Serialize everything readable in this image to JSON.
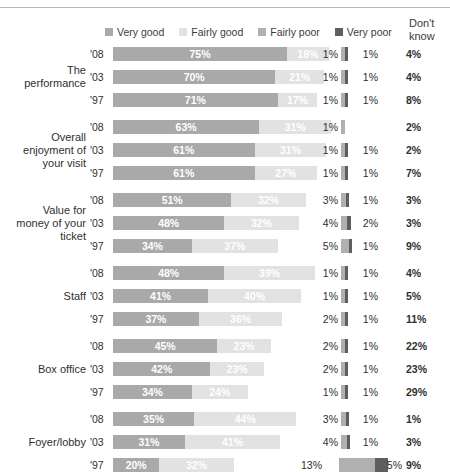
{
  "legend": {
    "items": [
      {
        "label": "Very good",
        "key": "very_good",
        "color": "#a9a9a9",
        "icon": "legend-swatch-icon"
      },
      {
        "label": "Fairly good",
        "key": "fairly_good",
        "color": "#e2e2e2",
        "icon": "legend-swatch-icon"
      },
      {
        "label": "Fairly poor",
        "key": "fairly_poor",
        "color": "#b0b0b0",
        "icon": "legend-swatch-icon"
      },
      {
        "label": "Very poor",
        "key": "very_poor",
        "color": "#5e5e5e",
        "icon": "legend-swatch-icon"
      }
    ]
  },
  "dont_know_header": "Don't\nknow",
  "dont_know_header_line1": "Don't",
  "dont_know_header_line2": "know",
  "chart_data": {
    "type": "bar",
    "subtype": "stacked-horizontal",
    "title": "",
    "xlabel": "",
    "ylabel": "",
    "xlim": [
      0,
      100
    ],
    "grid": false,
    "legend_position": "top",
    "units": "%",
    "series": [
      {
        "name": "Very good",
        "color": "#a9a9a9"
      },
      {
        "name": "Fairly good",
        "color": "#e2e2e2"
      },
      {
        "name": "Fairly poor",
        "color": "#b0b0b0"
      },
      {
        "name": "Very poor",
        "color": "#5e5e5e"
      }
    ],
    "extra_column": {
      "name": "Don't know"
    },
    "groups": [
      {
        "category": "The performance",
        "category_lines": [
          "The",
          "performance"
        ],
        "rows": [
          {
            "year": "'08",
            "very_good": 75,
            "fairly_good": 18,
            "fairly_poor": 1,
            "very_poor": 1,
            "dont_know": 4,
            "labels": {
              "very_good": "75%",
              "fairly_good": "18%",
              "fairly_poor": "1%",
              "very_poor": "1%",
              "dont_know": "4%"
            }
          },
          {
            "year": "'03",
            "very_good": 70,
            "fairly_good": 21,
            "fairly_poor": 1,
            "very_poor": 1,
            "dont_know": 4,
            "labels": {
              "very_good": "70%",
              "fairly_good": "21%",
              "fairly_poor": "1%",
              "very_poor": "1%",
              "dont_know": "4%"
            }
          },
          {
            "year": "'97",
            "very_good": 71,
            "fairly_good": 17,
            "fairly_poor": 1,
            "very_poor": 1,
            "dont_know": 8,
            "labels": {
              "very_good": "71%",
              "fairly_good": "17%",
              "fairly_poor": "1%",
              "very_poor": "1%",
              "dont_know": "8%"
            }
          }
        ]
      },
      {
        "category": "Overall enjoyment of your visit",
        "category_lines": [
          "Overall",
          "enjoyment of",
          "your visit"
        ],
        "rows": [
          {
            "year": "'08",
            "very_good": 63,
            "fairly_good": 31,
            "fairly_poor": 1,
            "very_poor": 0,
            "dont_know": 2,
            "labels": {
              "very_good": "63%",
              "fairly_good": "31%",
              "fairly_poor": "1%",
              "very_poor": "",
              "dont_know": "2%"
            }
          },
          {
            "year": "'03",
            "very_good": 61,
            "fairly_good": 31,
            "fairly_poor": 1,
            "very_poor": 1,
            "dont_know": 2,
            "labels": {
              "very_good": "61%",
              "fairly_good": "31%",
              "fairly_poor": "1%",
              "very_poor": "1%",
              "dont_know": "2%"
            }
          },
          {
            "year": "'97",
            "very_good": 61,
            "fairly_good": 27,
            "fairly_poor": 1,
            "very_poor": 1,
            "dont_know": 7,
            "labels": {
              "very_good": "61%",
              "fairly_good": "27%",
              "fairly_poor": "1%",
              "very_poor": "1%",
              "dont_know": "7%"
            }
          }
        ]
      },
      {
        "category": "Value for money of your ticket",
        "category_lines": [
          "Value for",
          "money of your",
          "ticket"
        ],
        "rows": [
          {
            "year": "'08",
            "very_good": 51,
            "fairly_good": 32,
            "fairly_poor": 3,
            "very_poor": 1,
            "dont_know": 3,
            "labels": {
              "very_good": "51%",
              "fairly_good": "32%",
              "fairly_poor": "3%",
              "very_poor": "1%",
              "dont_know": "3%"
            }
          },
          {
            "year": "'03",
            "very_good": 48,
            "fairly_good": 32,
            "fairly_poor": 4,
            "very_poor": 2,
            "dont_know": 3,
            "labels": {
              "very_good": "48%",
              "fairly_good": "32%",
              "fairly_poor": "4%",
              "very_poor": "2%",
              "dont_know": "3%"
            }
          },
          {
            "year": "'97",
            "very_good": 34,
            "fairly_good": 37,
            "fairly_poor": 5,
            "very_poor": 1,
            "dont_know": 9,
            "labels": {
              "very_good": "34%",
              "fairly_good": "37%",
              "fairly_poor": "5%",
              "very_poor": "1%",
              "dont_know": "9%"
            }
          }
        ]
      },
      {
        "category": "Staff",
        "category_lines": [
          "Staff"
        ],
        "rows": [
          {
            "year": "'08",
            "very_good": 48,
            "fairly_good": 39,
            "fairly_poor": 1,
            "very_poor": 1,
            "dont_know": 4,
            "labels": {
              "very_good": "48%",
              "fairly_good": "39%",
              "fairly_poor": "1%",
              "very_poor": "1%",
              "dont_know": "4%"
            }
          },
          {
            "year": "'03",
            "very_good": 41,
            "fairly_good": 40,
            "fairly_poor": 1,
            "very_poor": 1,
            "dont_know": 5,
            "labels": {
              "very_good": "41%",
              "fairly_good": "40%",
              "fairly_poor": "1%",
              "very_poor": "1%",
              "dont_know": "5%"
            }
          },
          {
            "year": "'97",
            "very_good": 37,
            "fairly_good": 36,
            "fairly_poor": 2,
            "very_poor": 1,
            "dont_know": 11,
            "labels": {
              "very_good": "37%",
              "fairly_good": "36%",
              "fairly_poor": "2%",
              "very_poor": "1%",
              "dont_know": "11%"
            }
          }
        ]
      },
      {
        "category": "Box office",
        "category_lines": [
          "Box office"
        ],
        "rows": [
          {
            "year": "'08",
            "very_good": 45,
            "fairly_good": 23,
            "fairly_poor": 2,
            "very_poor": 1,
            "dont_know": 22,
            "labels": {
              "very_good": "45%",
              "fairly_good": "23%",
              "fairly_poor": "2%",
              "very_poor": "1%",
              "dont_know": "22%"
            }
          },
          {
            "year": "'03",
            "very_good": 42,
            "fairly_good": 23,
            "fairly_poor": 2,
            "very_poor": 1,
            "dont_know": 23,
            "labels": {
              "very_good": "42%",
              "fairly_good": "23%",
              "fairly_poor": "2%",
              "very_poor": "1%",
              "dont_know": "23%"
            }
          },
          {
            "year": "'97",
            "very_good": 34,
            "fairly_good": 24,
            "fairly_poor": 1,
            "very_poor": 1,
            "dont_know": 29,
            "labels": {
              "very_good": "34%",
              "fairly_good": "24%",
              "fairly_poor": "1%",
              "very_poor": "1%",
              "dont_know": "29%"
            }
          }
        ]
      },
      {
        "category": "Foyer/lobby",
        "category_lines": [
          "Foyer/lobby"
        ],
        "rows": [
          {
            "year": "'08",
            "very_good": 35,
            "fairly_good": 44,
            "fairly_poor": 3,
            "very_poor": 1,
            "dont_know": 1,
            "labels": {
              "very_good": "35%",
              "fairly_good": "44%",
              "fairly_poor": "3%",
              "very_poor": "1%",
              "dont_know": "1%"
            }
          },
          {
            "year": "'03",
            "very_good": 31,
            "fairly_good": 41,
            "fairly_poor": 4,
            "very_poor": 1,
            "dont_know": 3,
            "labels": {
              "very_good": "31%",
              "fairly_good": "41%",
              "fairly_poor": "4%",
              "very_poor": "1%",
              "dont_know": "3%"
            }
          },
          {
            "year": "'97",
            "very_good": 20,
            "fairly_good": 32,
            "fairly_poor": 13,
            "very_poor": 5,
            "dont_know": 9,
            "labels": {
              "very_good": "20%",
              "fairly_good": "32%",
              "fairly_poor": "13%",
              "very_poor": "5%",
              "dont_know": "9%"
            }
          }
        ]
      }
    ]
  }
}
